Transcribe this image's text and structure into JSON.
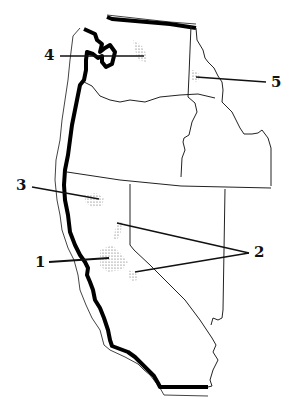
{
  "map": {
    "type": "outline map",
    "region": "Western United States (Washington, Oregon, Idaho, California, Nevada)",
    "colors": {
      "coastline": "#000000",
      "border": "#222222",
      "leader": "#111111",
      "stipple": "#555555",
      "background": "#ffffff"
    },
    "markers": [
      {
        "id": "1",
        "label": "1",
        "x": 40,
        "y": 262
      },
      {
        "id": "2",
        "label": "2",
        "x": 256,
        "y": 252
      },
      {
        "id": "3",
        "label": "3",
        "x": 20,
        "y": 187
      },
      {
        "id": "4",
        "label": "4",
        "x": 48,
        "y": 56
      },
      {
        "id": "5",
        "label": "5",
        "x": 272,
        "y": 82
      }
    ]
  }
}
